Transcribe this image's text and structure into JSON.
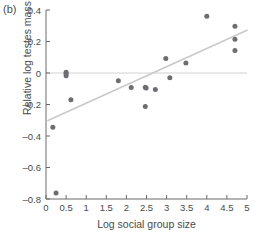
{
  "panel": {
    "label": "(b)"
  },
  "chart_data": {
    "type": "scatter",
    "title": "",
    "panel_label": "(b)",
    "xlabel": "Log social group size",
    "ylabel": "Relative log testes mass",
    "xlim": [
      0,
      5
    ],
    "ylim": [
      -0.8,
      0.4
    ],
    "xticks": [
      0,
      0.5,
      1,
      1.5,
      2,
      2.5,
      3,
      3.5,
      4,
      4.5,
      5
    ],
    "xticklabels": [
      "0",
      "0.5",
      "1",
      "1.5",
      "2",
      "2.5",
      "3",
      "3.5",
      "4",
      "4.5",
      "5"
    ],
    "yticks": [
      0.4,
      0.2,
      0,
      -0.2,
      -0.4,
      -0.6,
      -0.8
    ],
    "yticklabels": [
      "0.4",
      "0.2",
      "0",
      "–0.2",
      "–0.4",
      "–0.6",
      "–0.8"
    ],
    "grid": false,
    "legend": null,
    "point_color": "#6e6e72",
    "trendline_color": "#c9c9c9",
    "zeroline_color": "#d2d2d2",
    "axis_color": "#6a6a6a",
    "x": [
      0.17,
      0.25,
      0.5,
      0.5,
      0.5,
      0.62,
      1.8,
      2.12,
      2.47,
      2.47,
      2.49,
      2.72,
      2.98,
      3.08,
      3.48,
      4.0,
      4.7,
      4.7,
      4.7
    ],
    "y": [
      -0.345,
      -0.762,
      0.005,
      -0.005,
      -0.018,
      -0.17,
      -0.05,
      -0.092,
      -0.212,
      -0.09,
      -0.095,
      -0.105,
      0.092,
      -0.03,
      0.063,
      0.36,
      0.297,
      0.215,
      0.143
    ],
    "trendline": {
      "x": [
        0.05,
        5.0
      ],
      "y": [
        -0.302,
        0.272
      ]
    },
    "reference_line": {
      "y": 0.0
    }
  }
}
